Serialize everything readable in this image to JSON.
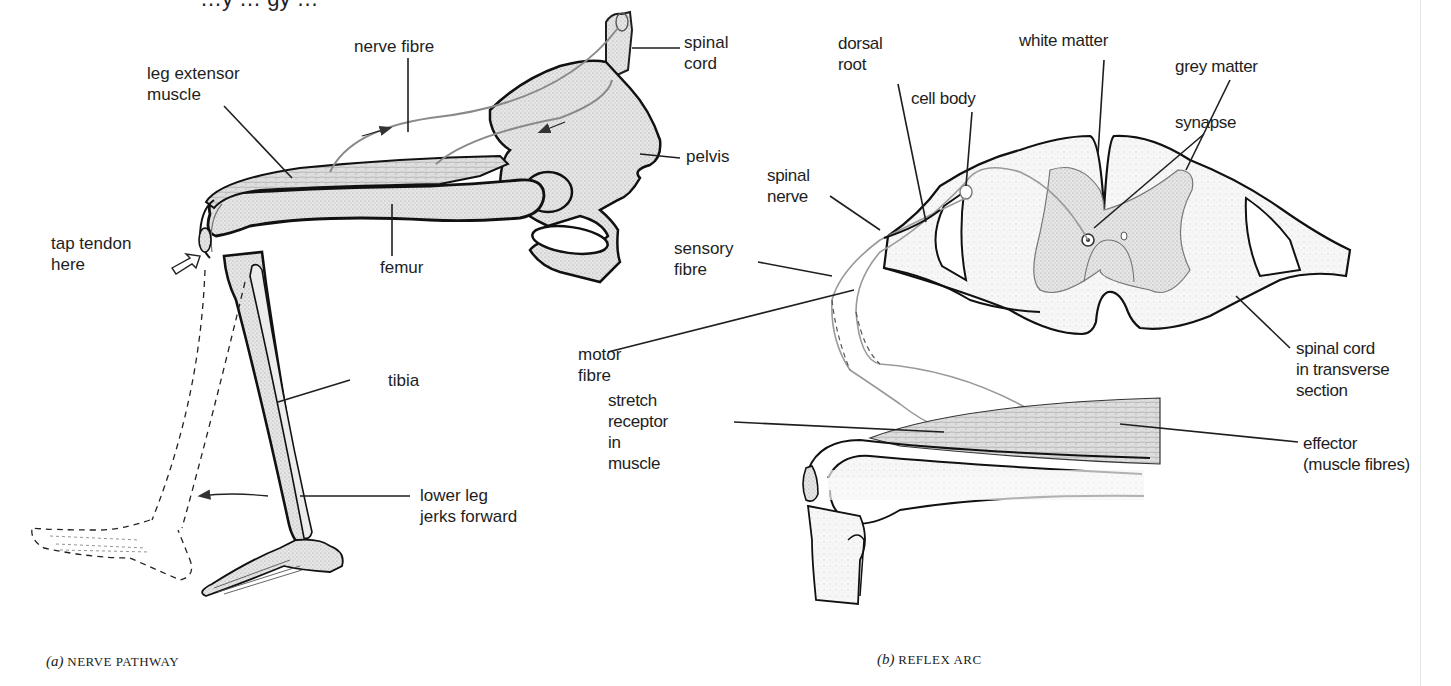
{
  "page": {
    "heading_fragment": "…y … gy …",
    "palette": {
      "ink": "#1e1e1e",
      "bone_fill": "#e2e2e2",
      "muscle_fill": "#d6d6d6",
      "cord_fill": "#f0f0f0",
      "nerve_line": "#8a8a8a",
      "rule": "#e4e4e4"
    }
  },
  "panel_a": {
    "caption_letter": "(a)",
    "caption_text": "NERVE PATHWAY",
    "labels": {
      "nerve_fibre": "nerve fibre",
      "spinal_cord": "spinal\ncord",
      "leg_extensor_muscle": "leg extensor\nmuscle",
      "pelvis": "pelvis",
      "femur": "femur",
      "tap_tendon_here": "tap tendon\nhere",
      "tibia": "tibia",
      "lower_leg_jerks_forward": "lower leg\njerks forward"
    }
  },
  "panel_b": {
    "caption_letter": "(b)",
    "caption_text": "REFLEX ARC",
    "labels": {
      "dorsal_root": "dorsal\nroot",
      "white_matter": "white matter",
      "cell_body": "cell body",
      "grey_matter": "grey matter",
      "synapse": "synapse",
      "spinal_nerve": "spinal\nnerve",
      "sensory_fibre": "sensory\nfibre",
      "motor_fibre": "motor\nfibre",
      "spinal_cord_transverse": "spinal cord\nin transverse\nsection",
      "stretch_receptor": "stretch\nreceptor\nin\nmuscle",
      "effector": "effector\n(muscle fibres)"
    }
  }
}
